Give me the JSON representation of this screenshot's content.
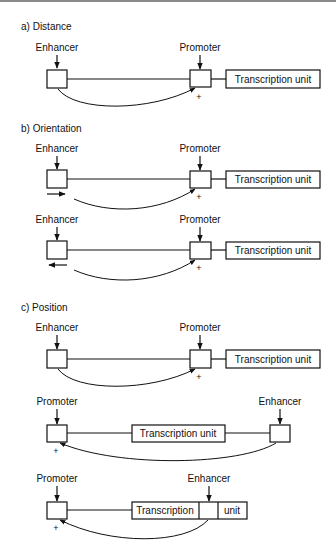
{
  "diagram": {
    "top_rule_color": "#888888",
    "sections": [
      {
        "title": "a) Distance",
        "rows": [
          {
            "labels": {
              "left": "Enhancer",
              "mid": "Promoter"
            },
            "unit": "Transcription unit",
            "plus": "+"
          }
        ]
      },
      {
        "title": "b) Orientation",
        "rows": [
          {
            "labels": {
              "left": "Enhancer",
              "mid": "Promoter"
            },
            "unit": "Transcription unit",
            "plus": "+",
            "orientation": "forward"
          },
          {
            "labels": {
              "left": "Enhancer",
              "mid": "Promoter"
            },
            "unit": "Transcription unit",
            "plus": "+",
            "orientation": "reverse"
          }
        ]
      },
      {
        "title": "c) Position",
        "rows": [
          {
            "labels": {
              "left": "Enhancer",
              "mid": "Promoter"
            },
            "unit": "Transcription unit",
            "plus": "+"
          },
          {
            "labels": {
              "left": "Promoter",
              "right": "Enhancer"
            },
            "unit": "Transcription unit",
            "plus": "+"
          },
          {
            "labels": {
              "left": "Promoter",
              "right": "Enhancer"
            },
            "unit_part1": "Transcription",
            "unit_part2": "unit",
            "plus": "+"
          }
        ]
      }
    ]
  }
}
